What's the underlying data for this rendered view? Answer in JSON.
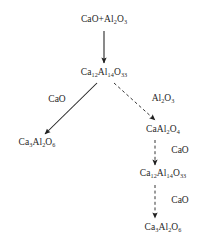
{
  "diagram": {
    "type": "reaction-pathway-flowchart",
    "title": "",
    "background_color": "#ffffff",
    "ink_color": "#1f1f1f",
    "nodes": [
      {
        "id": "reactants",
        "name": "node-reactants",
        "label": "CaO+Al2O3",
        "parts": [
          {
            "t": "CaO+Al",
            "sub": false
          },
          {
            "t": "2",
            "sub": true
          },
          {
            "t": "O",
            "sub": false
          },
          {
            "t": "3",
            "sub": true
          }
        ],
        "x": 104,
        "y": 20
      },
      {
        "id": "mayenite-1",
        "name": "node-mayenite-upper",
        "label": "Ca12Al14O33",
        "parts": [
          {
            "t": "Ca",
            "sub": false
          },
          {
            "t": "12",
            "sub": true
          },
          {
            "t": "Al",
            "sub": false
          },
          {
            "t": "14",
            "sub": true
          },
          {
            "t": "O",
            "sub": false
          },
          {
            "t": "33",
            "sub": true
          }
        ],
        "x": 104,
        "y": 73
      },
      {
        "id": "c3a-left",
        "name": "node-tricalcium-aluminate-left",
        "label": "Ca3Al2O6",
        "parts": [
          {
            "t": "Ca",
            "sub": false
          },
          {
            "t": "3",
            "sub": true
          },
          {
            "t": "Al",
            "sub": false
          },
          {
            "t": "2",
            "sub": true
          },
          {
            "t": "O",
            "sub": false
          },
          {
            "t": "6",
            "sub": true
          }
        ],
        "x": 37,
        "y": 143
      },
      {
        "id": "ca2",
        "name": "node-calcium-aluminate",
        "label": "CaAl2O4",
        "parts": [
          {
            "t": "CaAl",
            "sub": false
          },
          {
            "t": "2",
            "sub": true
          },
          {
            "t": "O",
            "sub": false
          },
          {
            "t": "4",
            "sub": true
          }
        ],
        "x": 163,
        "y": 130
      },
      {
        "id": "mayenite-2",
        "name": "node-mayenite-lower",
        "label": "Ca12Al14O33",
        "parts": [
          {
            "t": "Ca",
            "sub": false
          },
          {
            "t": "12",
            "sub": true
          },
          {
            "t": "Al",
            "sub": false
          },
          {
            "t": "14",
            "sub": true
          },
          {
            "t": "O",
            "sub": false
          },
          {
            "t": "33",
            "sub": true
          }
        ],
        "x": 163,
        "y": 174
      },
      {
        "id": "c3a-bottom",
        "name": "node-tricalcium-aluminate-bottom",
        "label": "Ca3Al2O6",
        "parts": [
          {
            "t": "Ca",
            "sub": false
          },
          {
            "t": "3",
            "sub": true
          },
          {
            "t": "Al",
            "sub": false
          },
          {
            "t": "2",
            "sub": true
          },
          {
            "t": "O",
            "sub": false
          },
          {
            "t": "6",
            "sub": true
          }
        ],
        "x": 163,
        "y": 228
      }
    ],
    "edges": [
      {
        "id": "e1",
        "name": "arrow-reactants-to-mayenite",
        "from": "reactants",
        "to": "mayenite-1",
        "style": "solid",
        "x1": 104,
        "y1": 31,
        "x2": 104,
        "y2": 63
      },
      {
        "id": "e2",
        "name": "arrow-mayenite-to-c3a",
        "from": "mayenite-1",
        "to": "c3a-left",
        "style": "solid",
        "x1": 97,
        "y1": 83,
        "x2": 45,
        "y2": 134
      },
      {
        "id": "e3",
        "name": "arrow-mayenite-to-calcium-aluminate",
        "from": "mayenite-1",
        "to": "ca2",
        "style": "dashed",
        "x1": 114,
        "y1": 83,
        "x2": 155,
        "y2": 120
      },
      {
        "id": "e4",
        "name": "arrow-calcium-aluminate-to-mayenite",
        "from": "ca2",
        "to": "mayenite-2",
        "style": "dashed",
        "x1": 155,
        "y1": 140,
        "x2": 155,
        "y2": 165
      },
      {
        "id": "e5",
        "name": "arrow-mayenite-to-c3a-bottom",
        "from": "mayenite-2",
        "to": "c3a-bottom",
        "style": "dashed",
        "x1": 155,
        "y1": 185,
        "x2": 155,
        "y2": 218
      }
    ],
    "edge_labels": [
      {
        "id": "l1",
        "name": "edge-label-cao-left",
        "edge": "e2",
        "label": "CaO",
        "parts": [
          {
            "t": "CaO",
            "sub": false
          }
        ],
        "x": 57,
        "y": 100
      },
      {
        "id": "l2",
        "name": "edge-label-alumina",
        "edge": "e3",
        "label": "Al2O3",
        "parts": [
          {
            "t": "Al",
            "sub": false
          },
          {
            "t": "2",
            "sub": true
          },
          {
            "t": "O",
            "sub": false
          },
          {
            "t": "3",
            "sub": true
          }
        ],
        "x": 163,
        "y": 99
      },
      {
        "id": "l3",
        "name": "edge-label-cao-middle",
        "edge": "e4",
        "label": "CaO",
        "parts": [
          {
            "t": "CaO",
            "sub": false
          }
        ],
        "x": 180,
        "y": 151
      },
      {
        "id": "l4",
        "name": "edge-label-cao-lower",
        "edge": "e5",
        "label": "CaO",
        "parts": [
          {
            "t": "CaO",
            "sub": false
          }
        ],
        "x": 180,
        "y": 201
      }
    ]
  }
}
